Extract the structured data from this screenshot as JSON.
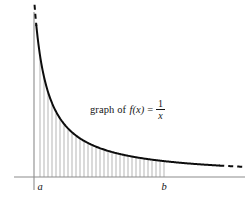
{
  "figure": {
    "kind": "math-figure",
    "background_color": "#ffffff",
    "annotation": {
      "prefix": "graph of",
      "function_name": "f(x)",
      "equals": "=",
      "fraction_numerator": "1",
      "fraction_denominator": "x",
      "plain": "graph of f(x) = 1/x",
      "x": 90,
      "y": 99
    },
    "axes": {
      "color": "#8c8c8c",
      "x_axis": {
        "x1": 14,
        "y1": 177,
        "x2": 245,
        "y2": 177
      },
      "y_axis": {
        "x1": 34,
        "y1": 12,
        "x2": 34,
        "y2": 190
      }
    },
    "tick_labels": [
      {
        "text": "a",
        "x": 40,
        "y": 190
      },
      {
        "text": "b",
        "x": 164,
        "y": 190
      }
    ],
    "curve": {
      "color": "#0d0d0d",
      "stroke_width": 2.0,
      "dash_pattern": "5 4"
    },
    "hatching": {
      "color": "#a8a8a8",
      "spacing_px": 4,
      "from_x": 40,
      "to_x": 165
    }
  },
  "chart_data": {
    "type": "line",
    "title": "",
    "subtitle": "",
    "xlabel": "",
    "ylabel": "",
    "function": "f(x) = 1/x",
    "annotations": [
      {
        "text": "graph of f(x) = 1/x",
        "x_px": 130,
        "y_px": 105
      },
      {
        "text": "a",
        "x_px": 40,
        "y_px": 190
      },
      {
        "text": "b",
        "x_px": 164,
        "y_px": 190
      }
    ],
    "grid": false,
    "legend": "none",
    "axis_origin_px": {
      "x": 34,
      "y": 177
    },
    "x_domain_label": [
      "a",
      "b"
    ],
    "shaded_region": {
      "style": "vertical-hatch",
      "from": "a",
      "to": "b",
      "description": "region under y = 1/x between x = a and x = b"
    },
    "series": [
      {
        "name": "f(x) = 1/x",
        "style": "solid-with-dashed-extensions",
        "x": [
          1.0,
          1.1,
          1.25,
          1.4,
          1.6,
          1.8,
          2.0,
          2.25,
          2.5,
          2.75,
          3.0,
          3.5,
          4.0,
          4.5,
          5.0,
          6.0,
          7.0,
          8.0,
          9.0,
          10.0,
          12.0,
          14.0
        ],
        "y": [
          1.0,
          0.909,
          0.8,
          0.714,
          0.625,
          0.556,
          0.5,
          0.444,
          0.4,
          0.364,
          0.333,
          0.286,
          0.25,
          0.222,
          0.2,
          0.167,
          0.143,
          0.125,
          0.111,
          0.1,
          0.083,
          0.071
        ]
      }
    ],
    "xlim": [
      0.85,
      14.5
    ],
    "ylim": [
      0,
      1.22
    ]
  }
}
